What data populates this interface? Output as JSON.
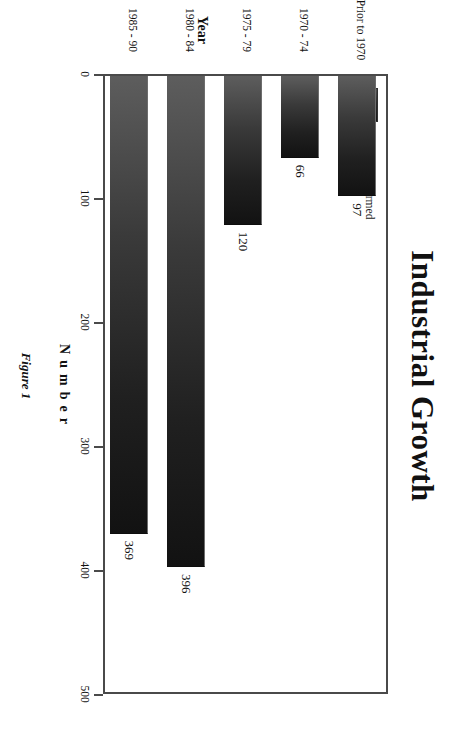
{
  "figure": {
    "title": "Industrial Growth",
    "caption": "Figure 1"
  },
  "legend": {
    "position": "top-left-inside-plot",
    "entries": [
      {
        "label": "Companies Formed",
        "swatch": "#2b2b2b"
      }
    ]
  },
  "axes": {
    "value_axis_title_letters": [
      "N",
      "u",
      "m",
      "b",
      "e",
      "r"
    ],
    "value_axis_title": "Number",
    "category_axis_title": "Year",
    "value_ticks": [
      "0",
      "100",
      "200",
      "300",
      "400",
      "500"
    ]
  },
  "chart_data": {
    "type": "bar",
    "orientation": "horizontal",
    "title": "Industrial Growth",
    "xlabel": "Number",
    "ylabel": "Year",
    "xlim": [
      0,
      500
    ],
    "grid": false,
    "legend_position": "top-left",
    "series": [
      {
        "name": "Companies Formed",
        "values": [
          97,
          66,
          120,
          396,
          369
        ]
      }
    ],
    "categories": [
      "Prior to 1970",
      "1970 - 74",
      "1975 - 79",
      "1980 - 84",
      "1985 - 90"
    ],
    "data_labels": [
      "97",
      "66",
      "120",
      "396",
      "369"
    ],
    "tick_values": [
      0,
      100,
      200,
      300,
      400,
      500
    ],
    "tick_labels": [
      "0",
      "100",
      "200",
      "300",
      "400",
      "500"
    ],
    "annotations": [
      "Figure 1"
    ]
  },
  "colors": {
    "bar_dark": "#121212",
    "bar_light": "#5d5d5d",
    "frame": "#4a4a4a",
    "text": "#111111",
    "background": "#ffffff"
  }
}
